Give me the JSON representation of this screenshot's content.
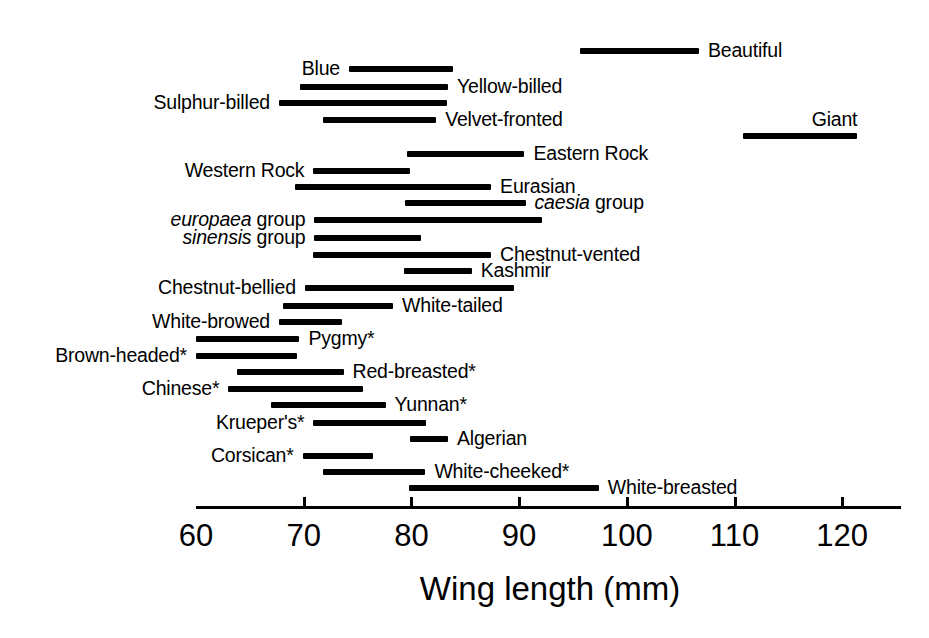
{
  "chart_data": {
    "type": "range_bar",
    "title": "",
    "xlabel": "Wing length (mm)",
    "ylabel": "",
    "xlim": [
      60,
      125.5
    ],
    "axis_start_value": 60,
    "axis_end_value": 125.5,
    "ticks": [
      60,
      70,
      80,
      90,
      100,
      110,
      120
    ],
    "tick_labels": [
      "60",
      "70",
      "80",
      "90",
      "100",
      "110",
      "120"
    ],
    "grid": false,
    "legend": null,
    "units": "mm",
    "note": "Asterisk (*) marks certain taxa",
    "series_name": "Wing length range",
    "rows": [
      {
        "label": "Beautiful",
        "label_html": "Beautiful",
        "label_side": "right",
        "min": 95.7,
        "max": 106.7,
        "italic": false
      },
      {
        "label": "Blue",
        "label_html": "Blue",
        "label_side": "left",
        "min": 74.2,
        "max": 83.9,
        "italic": false
      },
      {
        "label": "Yellow-billed",
        "label_html": "Yellow-billed",
        "label_side": "right",
        "min": 69.7,
        "max": 83.4,
        "italic": false
      },
      {
        "label": "Sulphur-billed",
        "label_html": "Sulphur-billed",
        "label_side": "left",
        "min": 67.7,
        "max": 83.3,
        "italic": false
      },
      {
        "label": "Velvet-fronted",
        "label_html": "Velvet-fronted",
        "label_side": "right",
        "min": 71.8,
        "max": 82.3,
        "italic": false
      },
      {
        "label": "Giant",
        "label_html": "Giant",
        "label_side": "above",
        "min": 110.8,
        "max": 121.4,
        "italic": false
      },
      {
        "label": "Eastern Rock",
        "label_html": "Eastern Rock",
        "label_side": "right",
        "min": 79.6,
        "max": 90.5,
        "italic": false
      },
      {
        "label": "Western Rock",
        "label_html": "Western Rock",
        "label_side": "left",
        "min": 70.9,
        "max": 79.9,
        "italic": false
      },
      {
        "label": "Eurasian",
        "label_html": "Eurasian",
        "label_side": "right",
        "min": 69.2,
        "max": 87.4,
        "italic": false
      },
      {
        "label": "caesia group",
        "label_html": "<i>caesia</i> group",
        "label_side": "right",
        "min": 79.4,
        "max": 90.6,
        "italic": true
      },
      {
        "label": "europaea group",
        "label_html": "<i>europaea</i> group",
        "label_side": "left",
        "min": 71.0,
        "max": 92.1,
        "italic": true
      },
      {
        "label": "sinensis group",
        "label_html": "<i>sinensis</i> group",
        "label_side": "left",
        "min": 71.0,
        "max": 80.9,
        "italic": true
      },
      {
        "label": "Chestnut-vented",
        "label_html": "Chestnut-vented",
        "label_side": "right",
        "min": 70.9,
        "max": 87.4,
        "italic": false
      },
      {
        "label": "Kashmir",
        "label_html": "Kashmir",
        "label_side": "right",
        "min": 79.3,
        "max": 85.6,
        "italic": false
      },
      {
        "label": "Chestnut-bellied",
        "label_html": "Chestnut-bellied",
        "label_side": "left",
        "min": 70.1,
        "max": 89.5,
        "italic": false
      },
      {
        "label": "White-tailed",
        "label_html": "White-tailed",
        "label_side": "right",
        "min": 68.1,
        "max": 78.3,
        "italic": false
      },
      {
        "label": "White-browed",
        "label_html": "White-browed",
        "label_side": "left",
        "min": 67.7,
        "max": 73.6,
        "italic": false
      },
      {
        "label": "Pygmy*",
        "label_html": "Pygmy*",
        "label_side": "right",
        "min": 60.0,
        "max": 69.6,
        "italic": false
      },
      {
        "label": "Brown-headed*",
        "label_html": "Brown-headed*",
        "label_side": "left",
        "min": 60.0,
        "max": 69.4,
        "italic": false
      },
      {
        "label": "Red-breasted*",
        "label_html": "Red-breasted*",
        "label_side": "right",
        "min": 63.8,
        "max": 73.7,
        "italic": false
      },
      {
        "label": "Chinese*",
        "label_html": "Chinese*",
        "label_side": "left",
        "min": 63.0,
        "max": 75.5,
        "italic": false
      },
      {
        "label": "Yunnan*",
        "label_html": "Yunnan*",
        "label_side": "right",
        "min": 67.0,
        "max": 77.6,
        "italic": false
      },
      {
        "label": "Krueper's*",
        "label_html": "Krueper's*",
        "label_side": "left",
        "min": 70.9,
        "max": 81.4,
        "italic": false
      },
      {
        "label": "Algerian",
        "label_html": "Algerian",
        "label_side": "right",
        "min": 79.9,
        "max": 83.4,
        "italic": false
      },
      {
        "label": "Corsican*",
        "label_html": "Corsican*",
        "label_side": "left",
        "min": 69.9,
        "max": 76.4,
        "italic": false
      },
      {
        "label": "White-cheeked*",
        "label_html": "White-cheeked*",
        "label_side": "right",
        "min": 71.8,
        "max": 81.3,
        "italic": false
      },
      {
        "label": "White-breasted",
        "label_html": "White-breasted",
        "label_side": "right",
        "min": 79.8,
        "max": 97.4,
        "italic": false
      }
    ]
  },
  "layout": {
    "row_y": [
      51,
      69,
      87,
      103,
      120,
      136,
      154,
      171,
      187,
      203,
      220,
      238,
      255,
      271,
      288,
      306,
      322,
      339,
      356,
      372,
      389,
      405,
      423,
      439,
      456,
      472,
      488
    ],
    "axis_y": 506,
    "px_per_unit": 10.77,
    "x_at_60": 196,
    "tick_label_y": 520,
    "axis_title_x": 550,
    "axis_title_y": 572
  },
  "colors": {
    "ink": "#000000",
    "background": "#ffffff"
  }
}
